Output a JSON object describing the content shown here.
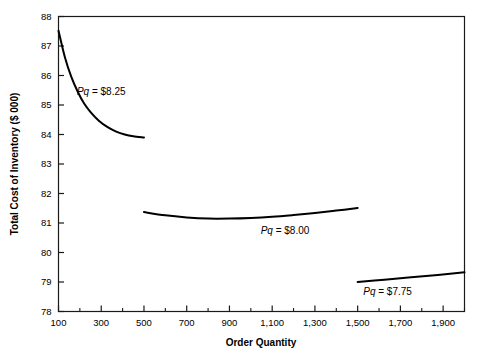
{
  "chart_data": {
    "type": "line",
    "title": "",
    "xlabel": "Order Quantity",
    "ylabel": "Total Cost of Inventory ($ 000)",
    "xlim": [
      100,
      2000
    ],
    "ylim": [
      78,
      88
    ],
    "grid": false,
    "legend_position": "inline-annotations",
    "xticks": [
      100,
      300,
      500,
      700,
      900,
      1100,
      1300,
      1500,
      1700,
      1900
    ],
    "xticklabels": [
      "100",
      "300",
      "500",
      "700",
      "900",
      "1,100",
      "1,300",
      "1,500",
      "1,700",
      "1,900"
    ],
    "xminorticks": [
      200,
      400,
      600,
      800,
      1000,
      1200,
      1400,
      1600,
      1800,
      2000
    ],
    "yticks": [
      78,
      79,
      80,
      81,
      82,
      83,
      84,
      85,
      86,
      87,
      88
    ],
    "yticklabels": [
      "78",
      "79",
      "80",
      "81",
      "82",
      "83",
      "84",
      "85",
      "86",
      "87",
      "88"
    ],
    "series": [
      {
        "name": "Pq = $8.25",
        "label_prefix": "Pq",
        "label_suffix": " = $8.25",
        "color": "#000000",
        "x": [
          100,
          130,
          160,
          190,
          220,
          250,
          290,
          330,
          370,
          410,
          450,
          500
        ],
        "y": [
          87.52,
          86.62,
          85.95,
          85.45,
          85.05,
          84.76,
          84.46,
          84.25,
          84.1,
          84.0,
          83.94,
          83.9
        ]
      },
      {
        "name": "Pq = $8.00",
        "label_prefix": "Pq",
        "label_suffix": " = $8.00",
        "color": "#000000",
        "x": [
          500,
          600,
          700,
          800,
          900,
          1000,
          1100,
          1200,
          1300,
          1400,
          1500
        ],
        "y": [
          81.37,
          81.26,
          81.19,
          81.15,
          81.15,
          81.17,
          81.21,
          81.27,
          81.34,
          81.42,
          81.51
        ]
      },
      {
        "name": "Pq = $7.75",
        "label_prefix": "Pq",
        "label_suffix": " = $7.75",
        "color": "#000000",
        "x": [
          1500,
          1625,
          1750,
          1875,
          2000
        ],
        "y": [
          79.0,
          79.08,
          79.16,
          79.24,
          79.33
        ]
      }
    ],
    "annotations": [
      {
        "text_prefix": "Pq",
        "text_suffix": " = $8.25",
        "x": 300,
        "y": 85.35
      },
      {
        "text_prefix": "Pq",
        "text_suffix": " = $8.00",
        "x": 1160,
        "y": 80.62
      },
      {
        "text_prefix": "Pq",
        "text_suffix": " = $7.75",
        "x": 1640,
        "y": 78.55
      }
    ]
  },
  "axis": {
    "y_title": "Total Cost of Inventory ($ 000)",
    "x_title": "Order Quantity",
    "y_labels": [
      "88",
      "87",
      "86",
      "85",
      "84",
      "83",
      "82",
      "81",
      "80",
      "79",
      "78"
    ],
    "x_labels": [
      "100",
      "300",
      "500",
      "700",
      "900",
      "1,100",
      "1,300",
      "1,500",
      "1,700",
      "1,900"
    ]
  }
}
